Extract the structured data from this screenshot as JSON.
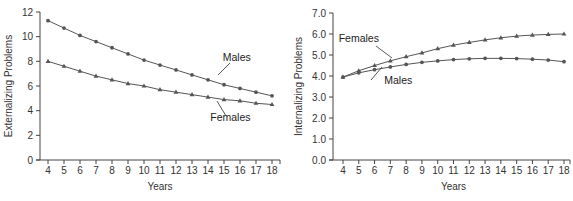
{
  "chart_data": [
    {
      "type": "line",
      "title": "",
      "xlabel": "Years",
      "ylabel": "Externalizing Problems",
      "x": [
        4,
        5,
        6,
        7,
        8,
        9,
        10,
        11,
        12,
        13,
        14,
        15,
        16,
        17,
        18
      ],
      "xticks": [
        "4",
        "5",
        "6",
        "7",
        "8",
        "9",
        "10",
        "11",
        "12",
        "13",
        "14",
        "15",
        "16",
        "17",
        "18"
      ],
      "yticks": [
        "0",
        "2",
        "4",
        "6",
        "8",
        "10",
        "12"
      ],
      "ylim": [
        0,
        12
      ],
      "grid": false,
      "legend": "inline labels",
      "series": [
        {
          "name": "Males",
          "marker": "circle",
          "values": [
            11.3,
            10.7,
            10.1,
            9.6,
            9.1,
            8.6,
            8.1,
            7.7,
            7.3,
            6.9,
            6.5,
            6.1,
            5.8,
            5.5,
            5.2
          ]
        },
        {
          "name": "Females",
          "marker": "triangle",
          "values": [
            8.0,
            7.6,
            7.2,
            6.8,
            6.5,
            6.2,
            6.0,
            5.7,
            5.5,
            5.3,
            5.1,
            4.9,
            4.8,
            4.6,
            4.5
          ]
        }
      ],
      "annotations": [
        {
          "text": "Males",
          "x": 15.8,
          "y": 8.0
        },
        {
          "text": "Females",
          "x": 15.4,
          "y": 3.2
        }
      ]
    },
    {
      "type": "line",
      "title": "",
      "xlabel": "Years",
      "ylabel": "Internalizing Problems",
      "x": [
        4,
        5,
        6,
        7,
        8,
        9,
        10,
        11,
        12,
        13,
        14,
        15,
        16,
        17,
        18
      ],
      "xticks": [
        "4",
        "5",
        "6",
        "7",
        "8",
        "9",
        "10",
        "11",
        "12",
        "13",
        "14",
        "15",
        "16",
        "17",
        "18"
      ],
      "yticks": [
        "0.0",
        "1.0",
        "2.0",
        "3.0",
        "4.0",
        "5.0",
        "6.0",
        "7.0"
      ],
      "ylim": [
        0,
        7
      ],
      "grid": false,
      "legend": "inline labels",
      "series": [
        {
          "name": "Females",
          "marker": "triangle",
          "values": [
            3.95,
            4.25,
            4.5,
            4.72,
            4.92,
            5.1,
            5.3,
            5.47,
            5.6,
            5.72,
            5.82,
            5.9,
            5.95,
            5.98,
            6.0
          ]
        },
        {
          "name": "Males",
          "marker": "circle",
          "values": [
            3.95,
            4.15,
            4.3,
            4.43,
            4.55,
            4.65,
            4.72,
            4.78,
            4.82,
            4.84,
            4.84,
            4.83,
            4.8,
            4.76,
            4.68
          ]
        }
      ],
      "annotations": [
        {
          "text": "Females",
          "x": 5.0,
          "y": 5.6
        },
        {
          "text": "Males",
          "x": 7.5,
          "y": 3.6
        }
      ]
    }
  ]
}
